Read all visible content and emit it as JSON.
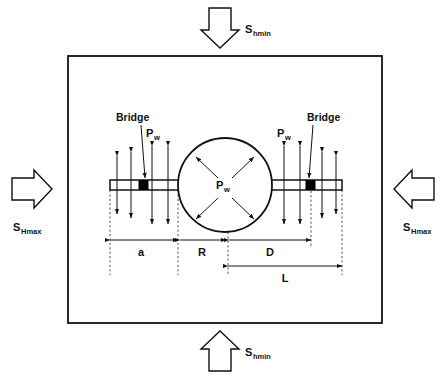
{
  "figure": {
    "type": "engineering-schematic"
  },
  "stresses": {
    "top": {
      "symbol": "S",
      "subscript": "hmin",
      "arrow": "down-arrow-icon",
      "label": "S"
    },
    "bottom": {
      "symbol": "S",
      "subscript": "hmin",
      "arrow": "up-arrow-icon",
      "label": "S"
    },
    "left": {
      "symbol": "S",
      "subscript": "Hmax",
      "arrow": "right-arrow-icon",
      "label": "S"
    },
    "right": {
      "symbol": "S",
      "subscript": "Hmax",
      "arrow": "left-arrow-icon",
      "label": "S"
    }
  },
  "wellbore": {
    "pressure_symbol": "P",
    "pressure_subscript": "w",
    "shape": "circle"
  },
  "fracture": {
    "left_pressure_symbol": "P",
    "left_pressure_subscript": "w",
    "right_pressure_symbol": "P",
    "right_pressure_subscript": "w"
  },
  "bridges": [
    {
      "label": "Bridge",
      "side": "left"
    },
    {
      "label": "Bridge",
      "side": "right"
    }
  ],
  "dimensions": [
    {
      "name": "a",
      "label": "a"
    },
    {
      "name": "R",
      "label": "R"
    },
    {
      "name": "D",
      "label": "D"
    },
    {
      "name": "L",
      "label": "L"
    }
  ],
  "colors": {
    "stroke": "#111111",
    "background": "#ffffff",
    "bridge_fill": "#000000",
    "dashed": "#555555"
  }
}
